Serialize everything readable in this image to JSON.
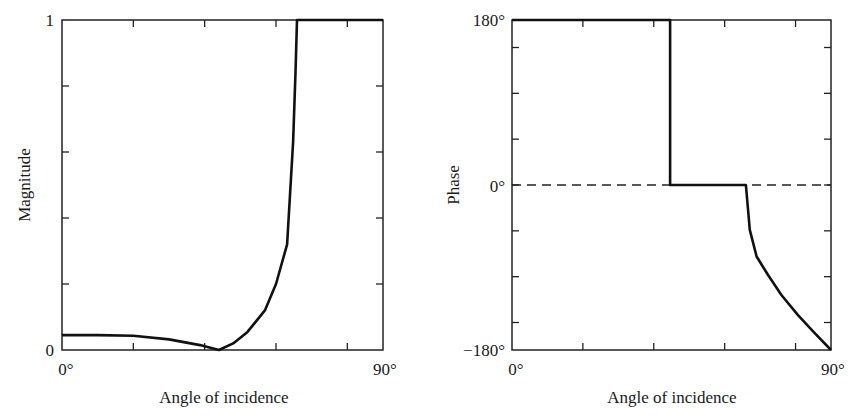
{
  "chart_data": [
    {
      "type": "line",
      "title": "",
      "xlabel": "Angle of incidence",
      "ylabel": "Magnitude",
      "xlim": [
        0,
        90
      ],
      "ylim": [
        0,
        1
      ],
      "x_ticks": [
        0,
        20,
        40,
        60,
        80,
        90
      ],
      "x_tick_labels": [
        "0°",
        "90°"
      ],
      "y_ticks": [
        0,
        0.2,
        0.4,
        0.6,
        0.8,
        1
      ],
      "y_tick_labels": [
        "0",
        "1"
      ],
      "grid": false,
      "series": [
        {
          "name": "Magnitude",
          "x": [
            0,
            10,
            20,
            30,
            38.7,
            44,
            48,
            52,
            56.9,
            60,
            63.1,
            64.8,
            65.5,
            65.9,
            70,
            80,
            90
          ],
          "y": [
            0.045,
            0.045,
            0.043,
            0.032,
            0.015,
            0.0,
            0.02,
            0.055,
            0.12,
            0.2,
            0.32,
            0.63,
            0.85,
            1.0,
            1.0,
            1.0,
            1.0
          ]
        }
      ]
    },
    {
      "type": "line",
      "title": "",
      "xlabel": "Angle of incidence",
      "ylabel": "Phase",
      "xlim": [
        0,
        90
      ],
      "ylim": [
        -180,
        180
      ],
      "x_ticks": [
        0,
        20,
        40,
        60,
        80,
        90
      ],
      "x_tick_labels": [
        "0°",
        "90°"
      ],
      "y_ticks": [
        -180,
        -150,
        -100,
        -50,
        0,
        50,
        100,
        150,
        180
      ],
      "y_tick_labels": [
        "−180°",
        "0°",
        "180°"
      ],
      "reference_line": {
        "y": 0,
        "style": "dashed"
      },
      "grid": false,
      "series": [
        {
          "name": "Phase",
          "x": [
            0,
            44.6,
            44.6,
            66,
            66,
            67.1,
            69,
            72.2,
            76,
            80.7,
            85,
            90
          ],
          "y": [
            180,
            180,
            0,
            0,
            0,
            -49,
            -78,
            -98,
            -120,
            -142,
            -160,
            -180
          ]
        }
      ]
    }
  ],
  "labels": {
    "left": {
      "ylabel": "Magnitude",
      "xlabel": "Angle of incidence",
      "x0": "0°",
      "x1": "90°",
      "y0": "0",
      "y1": "1"
    },
    "right": {
      "ylabel": "Phase",
      "xlabel": "Angle of incidence",
      "x0": "0°",
      "x1": "90°",
      "ytop": "180°",
      "ymid": "0°",
      "ybot": "−180°"
    }
  }
}
